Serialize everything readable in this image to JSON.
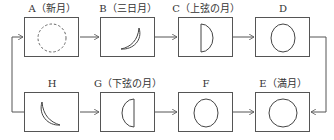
{
  "diagram": {
    "top_row": [
      {
        "id": "A",
        "label": "A（新月）",
        "phase": "new-moon"
      },
      {
        "id": "B",
        "label": "B（三日月）",
        "phase": "crescent"
      },
      {
        "id": "C",
        "label": "C（上弦の月）",
        "phase": "first-quarter"
      },
      {
        "id": "D",
        "label": "D",
        "phase": "gibbous"
      }
    ],
    "bottom_row": [
      {
        "id": "H",
        "label": "H",
        "phase": "waning-crescent"
      },
      {
        "id": "G",
        "label": "G（下弦の月）",
        "phase": "last-quarter"
      },
      {
        "id": "F",
        "label": "F",
        "phase": "waning-gibbous"
      },
      {
        "id": "E",
        "label": "E（満月）",
        "phase": "full-moon"
      }
    ],
    "flow": [
      "A",
      "B",
      "C",
      "D",
      "E",
      "F",
      "G",
      "H",
      "A"
    ],
    "colors": {
      "stroke": "#555555",
      "background": "#ffffff"
    }
  }
}
